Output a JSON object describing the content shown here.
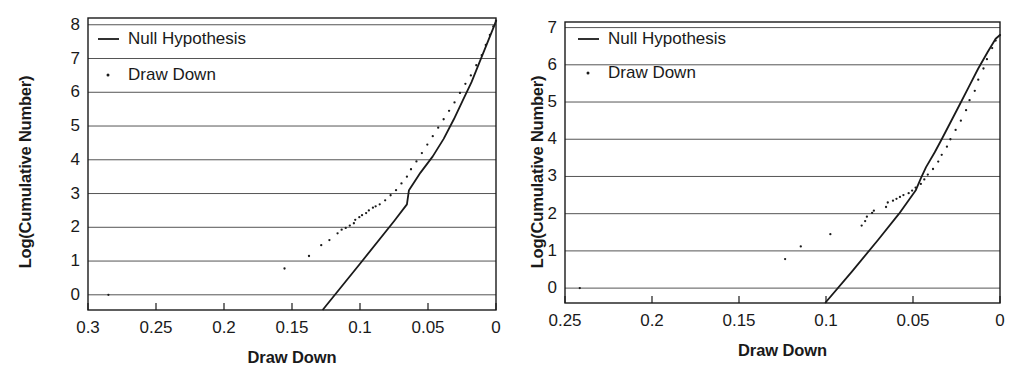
{
  "figure": {
    "panel_count": 2,
    "background": "#ffffff",
    "ink_color": "#1a1a1a",
    "grid_color": "#555555"
  },
  "chart_data": [
    {
      "type": "scatter",
      "panel": "left",
      "title": "",
      "xlabel": "Draw Down",
      "ylabel": "Log(Cumulative Number)",
      "xlim": [
        0.3,
        0.0
      ],
      "ylim": [
        -0.45,
        8.2
      ],
      "x_reversed": true,
      "grid": true,
      "grid_axis": "y",
      "legend_position": "top-left",
      "xticks": [
        "0.3",
        "0.25",
        "0.2",
        "0.15",
        "0.1",
        "0.05",
        "0"
      ],
      "xtick_values": [
        0.3,
        0.25,
        0.2,
        0.15,
        0.1,
        0.05,
        0.0
      ],
      "yticks": [
        "0",
        "1",
        "2",
        "3",
        "4",
        "5",
        "6",
        "7",
        "8"
      ],
      "ytick_values": [
        0,
        1,
        2,
        3,
        4,
        5,
        6,
        7,
        8
      ],
      "series": [
        {
          "name": "Null Hypothesis",
          "marker": "line",
          "type": "line",
          "color": "#1a1a1a",
          "points": [
            [
              0.1275,
              -0.45
            ],
            [
              0.1,
              0.92
            ],
            [
              0.075,
              2.18
            ],
            [
              0.0655,
              2.68
            ],
            [
              0.064,
              3.1
            ],
            [
              0.0555,
              3.62
            ],
            [
              0.0465,
              4.1
            ],
            [
              0.0385,
              4.62
            ],
            [
              0.031,
              5.2
            ],
            [
              0.0245,
              5.75
            ],
            [
              0.018,
              6.3
            ],
            [
              0.0115,
              6.95
            ],
            [
              0.006,
              7.5
            ],
            [
              0.0015,
              7.95
            ],
            [
              0.0,
              8.12
            ]
          ]
        },
        {
          "name": "Draw Down",
          "marker": "dot",
          "type": "scatter",
          "color": "#1a1a1a",
          "points": [
            [
              0.285,
              0.0
            ],
            [
              0.1555,
              0.78
            ],
            [
              0.1375,
              1.15
            ],
            [
              0.1285,
              1.47
            ],
            [
              0.1225,
              1.62
            ],
            [
              0.1165,
              1.82
            ],
            [
              0.1135,
              1.93
            ],
            [
              0.1105,
              1.98
            ],
            [
              0.1075,
              2.05
            ],
            [
              0.1045,
              2.12
            ],
            [
              0.1035,
              2.22
            ],
            [
              0.1005,
              2.3
            ],
            [
              0.0985,
              2.36
            ],
            [
              0.0955,
              2.42
            ],
            [
              0.0935,
              2.5
            ],
            [
              0.0905,
              2.58
            ],
            [
              0.0885,
              2.62
            ],
            [
              0.0855,
              2.68
            ],
            [
              0.0815,
              2.8
            ],
            [
              0.0775,
              2.95
            ],
            [
              0.0735,
              3.1
            ],
            [
              0.0695,
              3.3
            ],
            [
              0.0655,
              3.5
            ],
            [
              0.0625,
              3.72
            ],
            [
              0.0585,
              3.95
            ],
            [
              0.0545,
              4.2
            ],
            [
              0.0505,
              4.45
            ],
            [
              0.0465,
              4.7
            ],
            [
              0.0425,
              4.95
            ],
            [
              0.0385,
              5.2
            ],
            [
              0.0345,
              5.45
            ],
            [
              0.0305,
              5.7
            ],
            [
              0.0265,
              5.98
            ],
            [
              0.0225,
              6.25
            ],
            [
              0.0185,
              6.5
            ],
            [
              0.0145,
              6.8
            ],
            [
              0.0105,
              7.1
            ],
            [
              0.0075,
              7.4
            ],
            [
              0.0045,
              7.7
            ],
            [
              0.002,
              7.95
            ],
            [
              0.0,
              8.12
            ]
          ]
        }
      ]
    },
    {
      "type": "scatter",
      "panel": "right",
      "title": "",
      "xlabel": "Draw Down",
      "ylabel": "Log(Cumulative Number)",
      "xlim": [
        0.25,
        0.0
      ],
      "ylim": [
        -0.4,
        7.15
      ],
      "x_reversed": true,
      "grid": true,
      "grid_axis": "y",
      "legend_position": "top-left",
      "xticks": [
        "0.25",
        "0.2",
        "0.15",
        "0.1",
        "0.05",
        "0"
      ],
      "xtick_values": [
        0.25,
        0.2,
        0.15,
        0.1,
        0.05,
        0.0
      ],
      "yticks": [
        "0",
        "1",
        "2",
        "3",
        "4",
        "5",
        "6",
        "7"
      ],
      "ytick_values": [
        0,
        1,
        2,
        3,
        4,
        5,
        6,
        7
      ],
      "series": [
        {
          "name": "Null Hypothesis",
          "marker": "line",
          "type": "line",
          "color": "#1a1a1a",
          "points": [
            [
              0.1005,
              -0.4
            ],
            [
              0.085,
              0.45
            ],
            [
              0.07,
              1.3
            ],
            [
              0.058,
              2.0
            ],
            [
              0.0485,
              2.62
            ],
            [
              0.0455,
              2.95
            ],
            [
              0.0425,
              3.25
            ],
            [
              0.0375,
              3.65
            ],
            [
              0.0335,
              4.0
            ],
            [
              0.0285,
              4.45
            ],
            [
              0.0235,
              4.9
            ],
            [
              0.018,
              5.4
            ],
            [
              0.0125,
              5.9
            ],
            [
              0.007,
              6.35
            ],
            [
              0.0025,
              6.7
            ],
            [
              0.0,
              6.8
            ]
          ]
        },
        {
          "name": "Draw Down",
          "marker": "dot",
          "type": "scatter",
          "color": "#1a1a1a",
          "points": [
            [
              0.2415,
              0.0
            ],
            [
              0.1235,
              0.78
            ],
            [
              0.1145,
              1.12
            ],
            [
              0.0975,
              1.45
            ],
            [
              0.0795,
              1.68
            ],
            [
              0.0775,
              1.8
            ],
            [
              0.0765,
              1.92
            ],
            [
              0.0735,
              2.02
            ],
            [
              0.0725,
              2.08
            ],
            [
              0.0655,
              2.18
            ],
            [
              0.0645,
              2.3
            ],
            [
              0.0615,
              2.35
            ],
            [
              0.0595,
              2.4
            ],
            [
              0.0575,
              2.45
            ],
            [
              0.0555,
              2.5
            ],
            [
              0.0525,
              2.55
            ],
            [
              0.0505,
              2.62
            ],
            [
              0.0485,
              2.7
            ],
            [
              0.0455,
              2.8
            ],
            [
              0.0435,
              2.92
            ],
            [
              0.0415,
              3.05
            ],
            [
              0.0385,
              3.2
            ],
            [
              0.0355,
              3.4
            ],
            [
              0.0335,
              3.58
            ],
            [
              0.0305,
              3.8
            ],
            [
              0.0285,
              4.0
            ],
            [
              0.0255,
              4.25
            ],
            [
              0.0225,
              4.5
            ],
            [
              0.0195,
              4.78
            ],
            [
              0.0175,
              5.05
            ],
            [
              0.0145,
              5.3
            ],
            [
              0.0125,
              5.6
            ],
            [
              0.0095,
              5.9
            ],
            [
              0.0075,
              6.15
            ],
            [
              0.0045,
              6.45
            ],
            [
              0.0025,
              6.65
            ],
            [
              0.0,
              6.8
            ]
          ]
        }
      ]
    }
  ],
  "left_panel": {
    "ylabel": "Log(Cumulative Number)",
    "xlabel": "Draw Down",
    "yticks": [
      "8",
      "7",
      "6",
      "5",
      "4",
      "3",
      "2",
      "1",
      "0"
    ],
    "xticks": [
      "0.3",
      "0.25",
      "0.2",
      "0.15",
      "0.1",
      "0.05",
      "0"
    ],
    "legend": [
      {
        "label": "Null Hypothesis",
        "marker": "line"
      },
      {
        "label": "Draw Down",
        "marker": "dot"
      }
    ]
  },
  "right_panel": {
    "ylabel": "Log(Cumulative Number)",
    "xlabel": "Draw Down",
    "yticks": [
      "7",
      "6",
      "5",
      "4",
      "3",
      "2",
      "1",
      "0"
    ],
    "xticks": [
      "0.25",
      "0.2",
      "0.15",
      "0.1",
      "0.05",
      "0"
    ],
    "legend": [
      {
        "label": "Null Hypothesis",
        "marker": "line"
      },
      {
        "label": "Draw Down",
        "marker": "dot"
      }
    ]
  }
}
